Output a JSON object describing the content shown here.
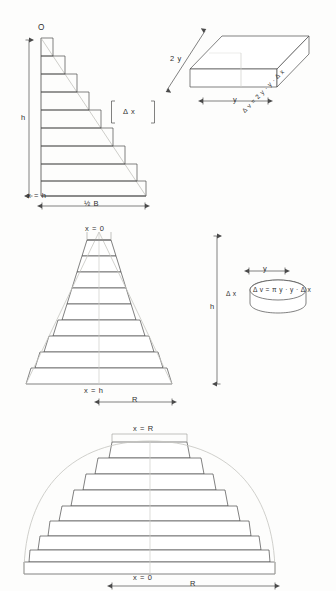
{
  "figure": {
    "panels": [
      {
        "id": "wedge-staircase",
        "labels": {
          "origin": "O",
          "height": "h",
          "x_bottom": "x = h",
          "base": "½ B",
          "delta_x": "Δ x"
        },
        "steps": 9
      },
      {
        "id": "slab-element",
        "labels": {
          "depth": "2 y",
          "volume": "Δ v = 2 y · y · Δ x",
          "width": "y"
        }
      },
      {
        "id": "cone-staircase",
        "labels": {
          "x_top": "x = 0",
          "x_bottom": "x = h",
          "height": "h",
          "radius": "R"
        },
        "steps": 9
      },
      {
        "id": "disc-element",
        "labels": {
          "radius": "y",
          "thickness": "Δ x",
          "volume": "Δ v = π y · y · Δ x"
        }
      },
      {
        "id": "dome-staircase",
        "labels": {
          "x_top": "x = R",
          "x_bottom": "x = 0",
          "radius": "R"
        },
        "steps": 9
      }
    ],
    "colors": {
      "ink": "#303030",
      "line": "#4a4a4a",
      "guide": "#b9b9b4",
      "paper": "#fdfdfc"
    }
  }
}
